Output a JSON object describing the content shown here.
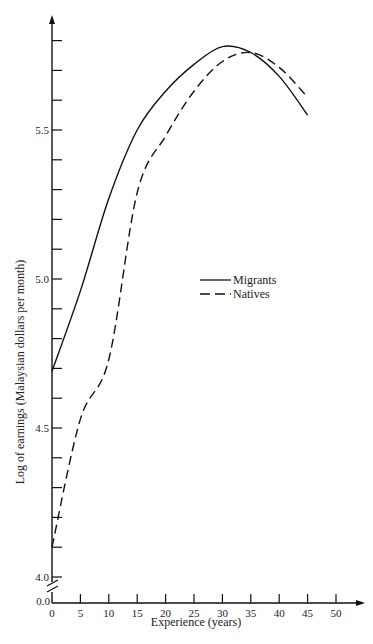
{
  "chart_data": {
    "type": "line",
    "title": "",
    "xlabel": "Experience (years)",
    "ylabel": "Log of earnings (Malaysian dollars per month)",
    "xlim": [
      0,
      50
    ],
    "ylim": [
      4.0,
      5.8
    ],
    "y_axis_break": true,
    "y_origin_label": "0.0",
    "x_ticks": [
      0,
      5,
      10,
      15,
      20,
      25,
      30,
      35,
      40,
      45,
      50
    ],
    "y_tick_step": 0.1,
    "y_labeled_ticks": [
      "4.0",
      "4.5",
      "5.0",
      "5.5"
    ],
    "grid": false,
    "legend_position": "center-right",
    "series": [
      {
        "name": "Migrants",
        "style": "solid",
        "x": [
          0,
          5,
          10,
          15,
          20,
          25,
          30,
          35,
          40,
          45
        ],
        "y": [
          4.69,
          4.96,
          5.27,
          5.5,
          5.63,
          5.72,
          5.78,
          5.76,
          5.68,
          5.55
        ]
      },
      {
        "name": "Natives",
        "style": "dashed",
        "x": [
          0,
          5,
          10,
          15,
          20,
          25,
          30,
          35,
          40,
          45
        ],
        "y": [
          4.1,
          4.53,
          4.73,
          5.29,
          5.48,
          5.63,
          5.73,
          5.76,
          5.71,
          5.61
        ]
      }
    ]
  },
  "labels": {
    "xlabel": "Experience (years)",
    "ylabel": "Log of earnings (Malaysian dollars per month)",
    "origin": "0.0",
    "legend": [
      "Migrants",
      "Natives"
    ]
  }
}
